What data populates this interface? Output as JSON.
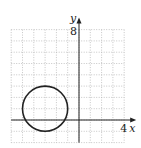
{
  "chart_data": {
    "type": "line",
    "title": "",
    "xlabel": "x",
    "ylabel": "y",
    "xlim": [
      -6,
      4
    ],
    "ylim": [
      -2,
      8
    ],
    "grid": true,
    "grid_style": "dotted",
    "tick_labels": {
      "x": [
        "4"
      ],
      "y": [
        "8"
      ]
    },
    "series": [
      {
        "name": "circle",
        "shape": "circle",
        "center": [
          -3,
          1
        ],
        "radius": 2,
        "color": "#222222"
      }
    ]
  },
  "labels": {
    "x_axis": "x",
    "y_axis": "y",
    "x_tick": "4",
    "y_tick": "8"
  },
  "colors": {
    "grid": "#b8b8b8",
    "axis": "#222222",
    "curve": "#222222"
  }
}
